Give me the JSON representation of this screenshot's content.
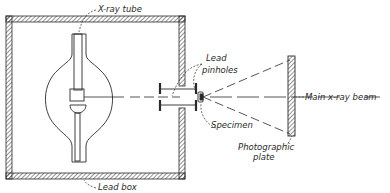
{
  "diagram": {
    "labels": {
      "xray_tube": "X-ray tube",
      "lead_pinholes_line1": "Lead",
      "lead_pinholes_line2": "pinholes",
      "main_beam": "Main x-ray beam",
      "specimen": "Specimen",
      "plate_line1": "Photographic",
      "plate_line2": "plate",
      "lead_box": "Lead box"
    },
    "colors": {
      "ink": "#2a2a2a",
      "background": "#ffffff"
    }
  }
}
